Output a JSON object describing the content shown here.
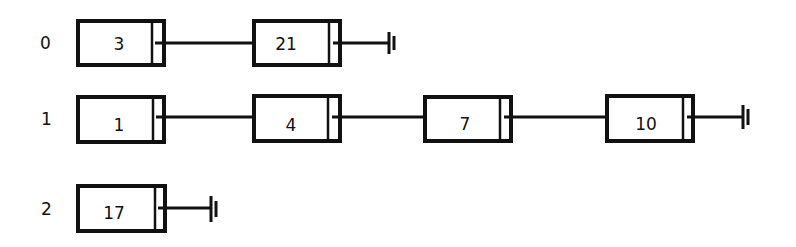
{
  "diagram": {
    "type": "hash-table-chains",
    "rows": [
      {
        "index_label": "0",
        "nodes": [
          "3",
          "21"
        ]
      },
      {
        "index_label": "1",
        "nodes": [
          "1",
          "4",
          "7",
          "10"
        ]
      },
      {
        "index_label": "2",
        "nodes": [
          "17"
        ]
      }
    ],
    "terminator": "null-ground-icon"
  }
}
